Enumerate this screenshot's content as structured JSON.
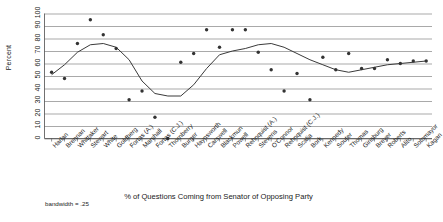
{
  "axes": {
    "ylabel": "Percent",
    "xlabel": "% of Questions Coming from Senator of Opposing Party",
    "yticks": [
      "0",
      "10",
      "20",
      "30",
      "40",
      "50",
      "60",
      "70",
      "80",
      "90",
      "100"
    ]
  },
  "annotation": {
    "bandwidth": "bandwidth = .25"
  },
  "chart_data": {
    "type": "scatter",
    "title": "",
    "subtitle": "",
    "xlabel": "% of Questions Coming from Senator of Opposing Party",
    "ylabel": "Percent",
    "ylim": [
      0,
      100
    ],
    "grid": true,
    "legend_position": "none",
    "annotations": [
      "bandwidth = .25"
    ],
    "categories": [
      "Harlan",
      "Brennan",
      "Whittaker",
      "Stewart",
      "White",
      "Goldberg",
      "Fortas (A.)",
      "Marshall",
      "Fortas (C.J.)",
      "Thornberry",
      "Burger",
      "Haynsworth",
      "Carswell",
      "Blackmun",
      "Powell",
      "Rehnquist (A.)",
      "Stevens",
      "O'Connor",
      "Rehnquist (C.J.)",
      "Scalia",
      "Bork",
      "Kennedy",
      "Souter",
      "Thomas",
      "Ginsburg",
      "Breyer",
      "Roberts",
      "Alito",
      "Sotomayor",
      "Kagan"
    ],
    "series": [
      {
        "name": "Observed percent",
        "type": "scatter",
        "values": [
          53,
          48,
          76,
          95,
          83,
          72,
          31,
          38,
          17,
          0,
          61,
          68,
          87,
          73,
          87,
          87,
          69,
          55,
          38,
          52,
          31,
          65,
          55,
          68,
          56,
          56,
          63,
          60,
          62,
          62
        ]
      },
      {
        "name": "Lowess smoothed fit",
        "type": "line",
        "values": [
          51,
          59,
          69,
          75,
          76,
          73,
          63,
          46,
          36,
          34,
          34,
          43,
          56,
          67,
          70,
          72,
          75,
          76,
          73,
          68,
          63,
          59,
          55,
          53,
          55,
          57,
          59,
          60,
          61,
          62
        ]
      }
    ]
  }
}
